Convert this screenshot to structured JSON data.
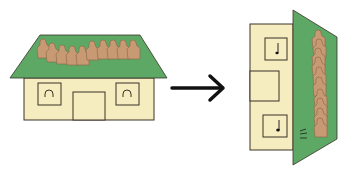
{
  "figure": {
    "colors": {
      "roof": "#5ea865",
      "wall": "#f5edc0",
      "outline": "#3a3326",
      "figure": "#c79a74",
      "arrow": "#111111"
    },
    "left_house": {
      "figure_count": 11,
      "windows": 2,
      "door": 1
    },
    "right_house": {
      "figure_count": 10,
      "windows": 2
    }
  }
}
